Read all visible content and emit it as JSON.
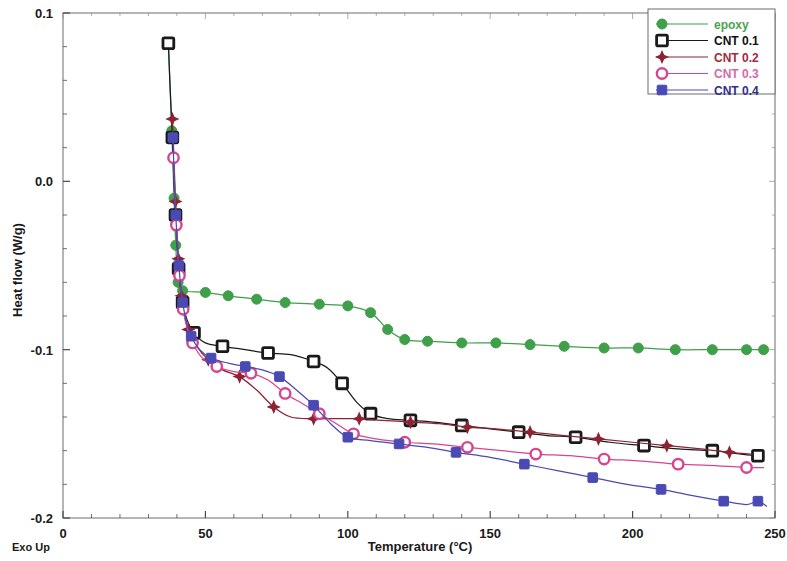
{
  "chart_data": {
    "type": "line",
    "title": "",
    "xlabel": "Temperature (°C)",
    "ylabel": "Heat flow (W/g)",
    "xlim": [
      0,
      250
    ],
    "ylim": [
      -0.2,
      0.1
    ],
    "xticks": [
      0,
      50,
      100,
      150,
      200,
      250
    ],
    "yticks": [
      0.1,
      0.0,
      -0.1,
      -0.2
    ],
    "xtick_labels": [
      "0",
      "50",
      "100",
      "150",
      "200",
      "250"
    ],
    "ytick_labels": [
      "0.1",
      "0.0",
      "-0.1",
      "-0.2"
    ],
    "x_minor_step": 10,
    "y_minor_step": 0.02,
    "grid": false,
    "legend_position": "top-right",
    "corner_note": "Exo Up",
    "series": [
      {
        "name": "epoxy",
        "color": "#3f9f4a",
        "text_color": "#4aa352",
        "marker": "filled-circle",
        "points": [
          [
            37.0,
            0.082
          ],
          [
            38.2,
            0.03
          ],
          [
            39.0,
            -0.01
          ],
          [
            39.6,
            -0.038
          ],
          [
            40.4,
            -0.06
          ],
          [
            42.0,
            -0.065
          ],
          [
            50.0,
            -0.066
          ],
          [
            58.0,
            -0.068
          ],
          [
            68.0,
            -0.07
          ],
          [
            78.0,
            -0.072
          ],
          [
            90.0,
            -0.073
          ],
          [
            100.0,
            -0.074
          ],
          [
            108.0,
            -0.078
          ],
          [
            114.0,
            -0.088
          ],
          [
            120.0,
            -0.094
          ],
          [
            128.0,
            -0.095
          ],
          [
            140.0,
            -0.096
          ],
          [
            152.0,
            -0.096
          ],
          [
            164.0,
            -0.097
          ],
          [
            176.0,
            -0.098
          ],
          [
            190.0,
            -0.099
          ],
          [
            202.0,
            -0.099
          ],
          [
            215.0,
            -0.1
          ],
          [
            228.0,
            -0.1
          ],
          [
            240.0,
            -0.1
          ],
          [
            246.0,
            -0.1
          ]
        ]
      },
      {
        "name": "CNT 0.1",
        "color": "#1a1a1a",
        "text_color": "#101010",
        "marker": "open-square",
        "points": [
          [
            37.0,
            0.082
          ],
          [
            37.6,
            0.056
          ],
          [
            38.4,
            0.026
          ],
          [
            39.0,
            -0.002
          ],
          [
            39.5,
            -0.02
          ],
          [
            40.0,
            -0.036
          ],
          [
            40.6,
            -0.052
          ],
          [
            41.2,
            -0.063
          ],
          [
            42.0,
            -0.072
          ],
          [
            43.5,
            -0.082
          ],
          [
            46.0,
            -0.09
          ],
          [
            50.0,
            -0.096
          ],
          [
            56.0,
            -0.098
          ],
          [
            64.0,
            -0.1
          ],
          [
            72.0,
            -0.102
          ],
          [
            80.0,
            -0.103
          ],
          [
            88.0,
            -0.107
          ],
          [
            93.0,
            -0.111
          ],
          [
            98.0,
            -0.12
          ],
          [
            103.0,
            -0.131
          ],
          [
            108.0,
            -0.138
          ],
          [
            114.0,
            -0.141
          ],
          [
            122.0,
            -0.142
          ],
          [
            130.0,
            -0.143
          ],
          [
            140.0,
            -0.145
          ],
          [
            150.0,
            -0.147
          ],
          [
            160.0,
            -0.149
          ],
          [
            170.0,
            -0.151
          ],
          [
            180.0,
            -0.152
          ],
          [
            192.0,
            -0.155
          ],
          [
            204.0,
            -0.157
          ],
          [
            216.0,
            -0.159
          ],
          [
            228.0,
            -0.16
          ],
          [
            238.0,
            -0.162
          ],
          [
            244.0,
            -0.163
          ]
        ]
      },
      {
        "name": "CNT 0.2",
        "color": "#8e2233",
        "text_color": "#a32b3c",
        "marker": "plus",
        "points": [
          [
            38.4,
            0.037
          ],
          [
            39.0,
            0.012
          ],
          [
            39.5,
            -0.012
          ],
          [
            40.0,
            -0.03
          ],
          [
            40.5,
            -0.046
          ],
          [
            41.0,
            -0.058
          ],
          [
            41.6,
            -0.068
          ],
          [
            42.4,
            -0.078
          ],
          [
            44.0,
            -0.088
          ],
          [
            47.0,
            -0.098
          ],
          [
            51.0,
            -0.106
          ],
          [
            56.0,
            -0.112
          ],
          [
            62.0,
            -0.116
          ],
          [
            68.0,
            -0.124
          ],
          [
            74.0,
            -0.134
          ],
          [
            80.0,
            -0.14
          ],
          [
            88.0,
            -0.141
          ],
          [
            96.0,
            -0.141
          ],
          [
            104.0,
            -0.141
          ],
          [
            112.0,
            -0.142
          ],
          [
            122.0,
            -0.143
          ],
          [
            132.0,
            -0.144
          ],
          [
            142.0,
            -0.146
          ],
          [
            152.0,
            -0.147
          ],
          [
            164.0,
            -0.149
          ],
          [
            176.0,
            -0.151
          ],
          [
            188.0,
            -0.153
          ],
          [
            200.0,
            -0.155
          ],
          [
            212.0,
            -0.157
          ],
          [
            224.0,
            -0.159
          ],
          [
            234.0,
            -0.161
          ],
          [
            242.0,
            -0.162
          ]
        ]
      },
      {
        "name": "CNT 0.3",
        "color": "#d6458f",
        "text_color": "#d66aa8",
        "marker": "open-circle",
        "points": [
          [
            38.8,
            0.014
          ],
          [
            39.3,
            -0.008
          ],
          [
            39.8,
            -0.026
          ],
          [
            40.3,
            -0.042
          ],
          [
            40.9,
            -0.056
          ],
          [
            41.5,
            -0.066
          ],
          [
            42.2,
            -0.076
          ],
          [
            43.4,
            -0.086
          ],
          [
            45.5,
            -0.096
          ],
          [
            49.0,
            -0.105
          ],
          [
            54.0,
            -0.11
          ],
          [
            60.0,
            -0.113
          ],
          [
            66.0,
            -0.114
          ],
          [
            72.0,
            -0.118
          ],
          [
            78.0,
            -0.126
          ],
          [
            84.0,
            -0.132
          ],
          [
            90.0,
            -0.138
          ],
          [
            96.0,
            -0.144
          ],
          [
            102.0,
            -0.15
          ],
          [
            110.0,
            -0.153
          ],
          [
            120.0,
            -0.155
          ],
          [
            130.0,
            -0.156
          ],
          [
            142.0,
            -0.158
          ],
          [
            154.0,
            -0.16
          ],
          [
            166.0,
            -0.162
          ],
          [
            178.0,
            -0.163
          ],
          [
            190.0,
            -0.165
          ],
          [
            202.0,
            -0.166
          ],
          [
            216.0,
            -0.168
          ],
          [
            230.0,
            -0.169
          ],
          [
            240.0,
            -0.17
          ],
          [
            246.0,
            -0.17
          ]
        ]
      },
      {
        "name": "CNT 0.4",
        "color": "#4a4ab5",
        "text_color": "#2f2f8c",
        "marker": "filled-square",
        "points": [
          [
            38.6,
            0.026
          ],
          [
            39.1,
            0.0
          ],
          [
            39.6,
            -0.02
          ],
          [
            40.1,
            -0.036
          ],
          [
            40.7,
            -0.05
          ],
          [
            41.3,
            -0.062
          ],
          [
            42.0,
            -0.072
          ],
          [
            43.2,
            -0.082
          ],
          [
            45.0,
            -0.092
          ],
          [
            48.0,
            -0.1
          ],
          [
            52.0,
            -0.105
          ],
          [
            58.0,
            -0.108
          ],
          [
            64.0,
            -0.11
          ],
          [
            70.0,
            -0.112
          ],
          [
            76.0,
            -0.116
          ],
          [
            82.0,
            -0.124
          ],
          [
            88.0,
            -0.133
          ],
          [
            94.0,
            -0.144
          ],
          [
            100.0,
            -0.152
          ],
          [
            108.0,
            -0.154
          ],
          [
            118.0,
            -0.156
          ],
          [
            128.0,
            -0.158
          ],
          [
            138.0,
            -0.161
          ],
          [
            150.0,
            -0.164
          ],
          [
            162.0,
            -0.168
          ],
          [
            174.0,
            -0.172
          ],
          [
            186.0,
            -0.176
          ],
          [
            198.0,
            -0.18
          ],
          [
            210.0,
            -0.183
          ],
          [
            222.0,
            -0.187
          ],
          [
            232.0,
            -0.19
          ],
          [
            240.0,
            -0.192
          ],
          [
            244.0,
            -0.19
          ],
          [
            247.0,
            -0.193
          ]
        ]
      }
    ],
    "legend": [
      {
        "label": "epoxy",
        "series": "epoxy"
      },
      {
        "label": "CNT 0.1",
        "series": "CNT 0.1"
      },
      {
        "label": "CNT 0.2",
        "series": "CNT 0.2"
      },
      {
        "label": "CNT 0.3",
        "series": "CNT 0.3"
      },
      {
        "label": "CNT 0.4",
        "series": "CNT 0.4"
      }
    ]
  }
}
